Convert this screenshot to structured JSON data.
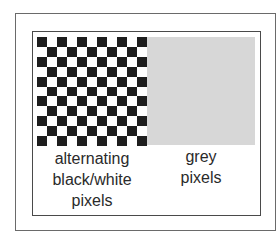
{
  "figure": {
    "checkerboard": {
      "rows": 11,
      "cols": 11,
      "dark_color": "#1e1e1e",
      "light_color": "#ffffff",
      "corner_dark": true
    },
    "grey_block": {
      "color": "#d7d7d7"
    },
    "labels": {
      "left": [
        "alternating",
        "black/white",
        "pixels"
      ],
      "right": [
        "grey",
        "pixels"
      ]
    }
  }
}
